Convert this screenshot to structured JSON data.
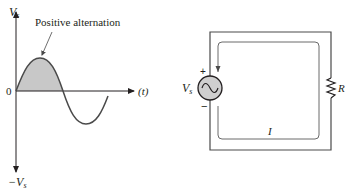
{
  "waveform": {
    "y_axis_top_label": "V",
    "y_axis_top_sub": "s",
    "y_axis_bottom_label": "−V",
    "y_axis_bottom_sub": "s",
    "origin_label": "0",
    "x_axis_label": "(t)",
    "annotation": "Positive alternation",
    "shaded_color": "#c8c8c8",
    "curve_color": "#4a4a4a"
  },
  "circuit": {
    "source_label": "V",
    "source_sub": "s",
    "source_plus": "+",
    "source_minus": "−",
    "resistor_label": "R",
    "current_label": "I",
    "source_fill": "#cfcfcf",
    "wire_color": "#4a4a4a"
  }
}
